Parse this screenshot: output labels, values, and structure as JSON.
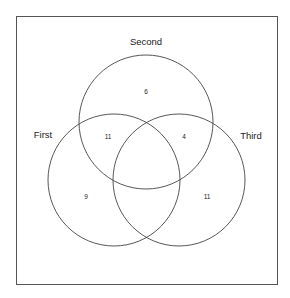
{
  "diagram": {
    "type": "venn-3",
    "sets": [
      {
        "name": "First",
        "cx": 114,
        "cy": 180,
        "r": 66,
        "label_x": 43,
        "label_y": 138
      },
      {
        "name": "Second",
        "cx": 146,
        "cy": 122,
        "r": 67,
        "label_x": 146,
        "label_y": 45
      },
      {
        "name": "Third",
        "cx": 179,
        "cy": 180,
        "r": 66,
        "label_x": 251,
        "label_y": 139
      }
    ],
    "regions": [
      {
        "id": "second_only",
        "label": "6",
        "x": 146,
        "y": 94
      },
      {
        "id": "first_second",
        "label": "11",
        "x": 108,
        "y": 139
      },
      {
        "id": "second_third",
        "label": "4",
        "x": 184,
        "y": 139
      },
      {
        "id": "first_only",
        "label": "9",
        "x": 86,
        "y": 199
      },
      {
        "id": "third_only",
        "label": "11",
        "x": 207,
        "y": 199
      },
      {
        "id": "first_third",
        "label": "",
        "x": 146,
        "y": 215
      },
      {
        "id": "all_three",
        "label": "",
        "x": 146,
        "y": 165
      }
    ],
    "frame": {
      "x": 16,
      "y": 16,
      "w": 261,
      "h": 268
    },
    "stroke_color": "#444444"
  }
}
